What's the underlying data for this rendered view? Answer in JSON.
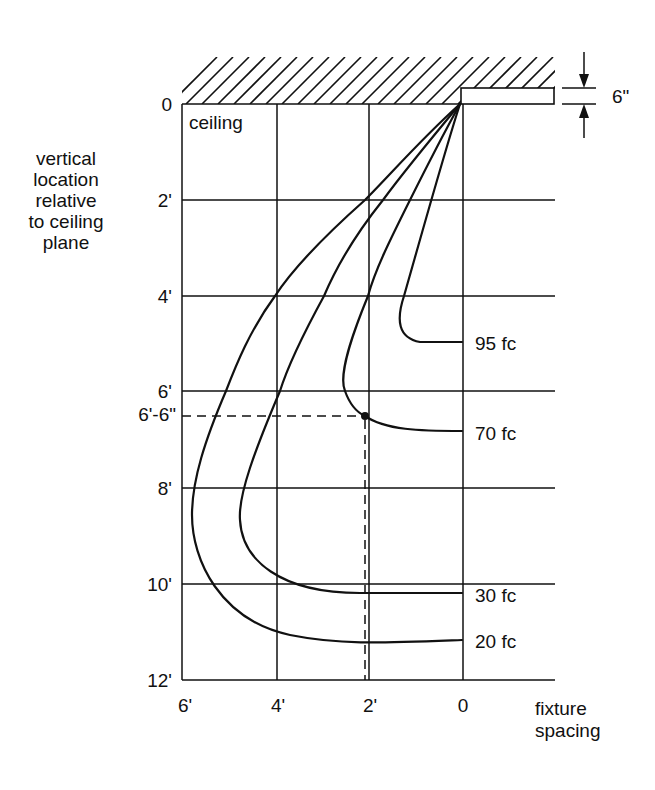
{
  "diagram": {
    "y_axis_title": [
      "vertical",
      "location",
      "relative",
      "to ceiling",
      "plane"
    ],
    "x_axis_title": [
      "fixture",
      "spacing"
    ],
    "ceiling_label": "ceiling",
    "fixture_height_label": "6\"",
    "y_ticks": [
      "0",
      "2'",
      "4'",
      "6'",
      "6'-6\"",
      "8'",
      "10'",
      "12'"
    ],
    "x_ticks": [
      "6'",
      "4'",
      "2'",
      "0"
    ],
    "curves": [
      {
        "label": "95 fc"
      },
      {
        "label": "70 fc"
      },
      {
        "label": "30 fc"
      },
      {
        "label": "20 fc"
      }
    ],
    "marker": {
      "spacing_ft": 2,
      "depth": "6'-6\""
    },
    "colors": {
      "line": "#111111",
      "background": "#ffffff"
    }
  }
}
